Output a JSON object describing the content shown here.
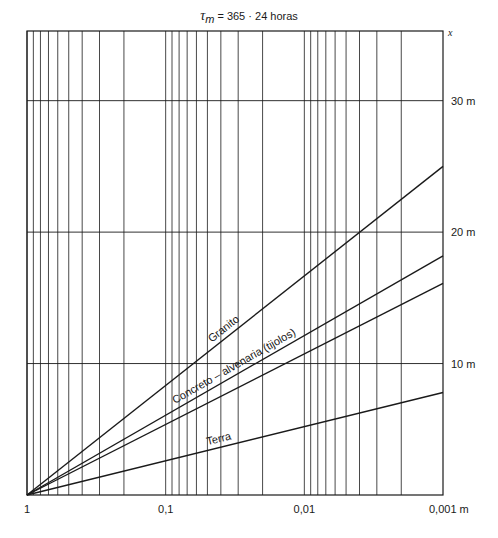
{
  "chart_data": {
    "type": "line",
    "title": "τm = 365 · 24 horas",
    "title_parts": {
      "symbol": "τ",
      "subscript": "m",
      "rest": " = 365 · 24 horas"
    },
    "xlabel": "",
    "ylabel": "x",
    "x_scale": "log",
    "x_reversed": true,
    "xlim": [
      1,
      0.001
    ],
    "ylim": [
      0,
      35.3
    ],
    "x_unit": "m",
    "y_unit": "m",
    "x_ticks": [
      {
        "value": 1,
        "label": "1"
      },
      {
        "value": 0.1,
        "label": "0,1"
      },
      {
        "value": 0.01,
        "label": "0,01"
      },
      {
        "value": 0.001,
        "label": "0,001 m"
      }
    ],
    "y_ticks": [
      {
        "value": 10,
        "label": "10 m"
      },
      {
        "value": 20,
        "label": "20 m"
      },
      {
        "value": 30,
        "label": "30 m"
      }
    ],
    "y_axis_label": "x",
    "grid": true,
    "x_minor_grid": [
      0.9,
      0.8,
      0.7,
      0.6,
      0.5,
      0.4,
      0.3,
      0.2
    ],
    "series": [
      {
        "name": "Granito",
        "label": "Granito",
        "x": [
          1,
          0.001
        ],
        "y": [
          0,
          25.0
        ]
      },
      {
        "name": "Concreto – alvenaria",
        "label": "Concreto – alvenaria (tijolos)",
        "x": [
          1,
          0.001
        ],
        "y": [
          0,
          18.2
        ]
      },
      {
        "name": "Alvenaria (tijolos)",
        "label": "",
        "x": [
          1,
          0.001
        ],
        "y": [
          0,
          16.1
        ]
      },
      {
        "name": "Terra",
        "label": "Terra",
        "x": [
          1,
          0.001
        ],
        "y": [
          0,
          7.8
        ]
      }
    ],
    "label_positions": [
      {
        "series": 0,
        "at_x": 0.035
      },
      {
        "series": 1,
        "at_x": 0.03
      },
      {
        "series": 3,
        "at_x": 0.04
      }
    ]
  },
  "colors": {
    "ink": "#1a1a1a",
    "background": "#ffffff"
  }
}
